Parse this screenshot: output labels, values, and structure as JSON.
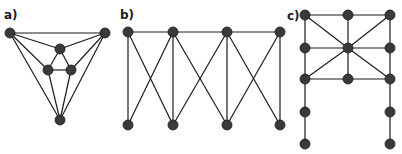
{
  "colors": {
    "node": "#3a3a3a",
    "edge": "#1c1c1c",
    "label": "#1a1a1a",
    "background": "#ffffff"
  },
  "panels": [
    {
      "label": "a)",
      "label_pos": [
        4,
        19
      ],
      "nodes": [
        {
          "id": "a1",
          "x": 10,
          "y": 33
        },
        {
          "id": "a2",
          "x": 105,
          "y": 33
        },
        {
          "id": "a3",
          "x": 60,
          "y": 49
        },
        {
          "id": "a4",
          "x": 48,
          "y": 70
        },
        {
          "id": "a5",
          "x": 71,
          "y": 70
        },
        {
          "id": "a6",
          "x": 60,
          "y": 120
        }
      ],
      "edges": [
        [
          "a1",
          "a2"
        ],
        [
          "a1",
          "a3"
        ],
        [
          "a1",
          "a4"
        ],
        [
          "a1",
          "a6"
        ],
        [
          "a2",
          "a3"
        ],
        [
          "a2",
          "a5"
        ],
        [
          "a2",
          "a6"
        ],
        [
          "a3",
          "a4"
        ],
        [
          "a3",
          "a5"
        ],
        [
          "a4",
          "a5"
        ],
        [
          "a4",
          "a6"
        ],
        [
          "a5",
          "a6"
        ]
      ]
    },
    {
      "label": "b)",
      "label_pos": [
        120,
        19
      ],
      "nodes": [
        {
          "id": "b1",
          "x": 128,
          "y": 32
        },
        {
          "id": "b2",
          "x": 173,
          "y": 32
        },
        {
          "id": "b3",
          "x": 227,
          "y": 32
        },
        {
          "id": "b4",
          "x": 280,
          "y": 32
        },
        {
          "id": "b5",
          "x": 128,
          "y": 125
        },
        {
          "id": "b6",
          "x": 173,
          "y": 125
        },
        {
          "id": "b7",
          "x": 227,
          "y": 125
        },
        {
          "id": "b8",
          "x": 280,
          "y": 125
        }
      ],
      "edges": [
        [
          "b1",
          "b2"
        ],
        [
          "b2",
          "b3"
        ],
        [
          "b3",
          "b4"
        ],
        [
          "b1",
          "b5"
        ],
        [
          "b1",
          "b6"
        ],
        [
          "b2",
          "b5"
        ],
        [
          "b2",
          "b6"
        ],
        [
          "b2",
          "b7"
        ],
        [
          "b3",
          "b6"
        ],
        [
          "b3",
          "b7"
        ],
        [
          "b3",
          "b8"
        ],
        [
          "b4",
          "b7"
        ],
        [
          "b4",
          "b8"
        ]
      ]
    },
    {
      "label": "c)",
      "label_pos": [
        287,
        20
      ],
      "nodes": [
        {
          "id": "c1",
          "x": 305,
          "y": 15
        },
        {
          "id": "c2",
          "x": 348,
          "y": 15
        },
        {
          "id": "c3",
          "x": 390,
          "y": 15
        },
        {
          "id": "c4",
          "x": 305,
          "y": 48
        },
        {
          "id": "c5",
          "x": 348,
          "y": 48
        },
        {
          "id": "c6",
          "x": 390,
          "y": 48
        },
        {
          "id": "c7",
          "x": 305,
          "y": 79
        },
        {
          "id": "c8",
          "x": 348,
          "y": 79
        },
        {
          "id": "c9",
          "x": 390,
          "y": 79
        },
        {
          "id": "c10",
          "x": 305,
          "y": 112
        },
        {
          "id": "c11",
          "x": 390,
          "y": 112
        },
        {
          "id": "c12",
          "x": 305,
          "y": 144
        },
        {
          "id": "c13",
          "x": 390,
          "y": 144
        }
      ],
      "edges": [
        [
          "c1",
          "c2"
        ],
        [
          "c2",
          "c3"
        ],
        [
          "c4",
          "c5"
        ],
        [
          "c5",
          "c6"
        ],
        [
          "c7",
          "c8"
        ],
        [
          "c8",
          "c9"
        ],
        [
          "c1",
          "c4"
        ],
        [
          "c4",
          "c7"
        ],
        [
          "c2",
          "c5"
        ],
        [
          "c5",
          "c8"
        ],
        [
          "c3",
          "c6"
        ],
        [
          "c6",
          "c9"
        ],
        [
          "c1",
          "c5"
        ],
        [
          "c3",
          "c5"
        ],
        [
          "c7",
          "c5"
        ],
        [
          "c9",
          "c5"
        ],
        [
          "c7",
          "c10"
        ],
        [
          "c10",
          "c12"
        ],
        [
          "c9",
          "c11"
        ],
        [
          "c11",
          "c13"
        ]
      ]
    }
  ]
}
